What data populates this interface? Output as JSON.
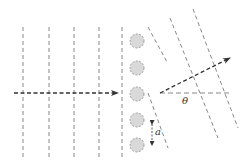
{
  "diagram": {
    "labels": {
      "angle": "θ",
      "spacing": "a"
    },
    "colors": {
      "line": "#555555",
      "arrow": "#333333",
      "scatterer_fill": "#d9d9d9",
      "scatterer_stroke": "#888888",
      "background": "#ffffff"
    },
    "incident_wavefronts_x": [
      23,
      49,
      74,
      99,
      122
    ],
    "scatterers": [
      {
        "cx": 137,
        "cy": 41
      },
      {
        "cx": 137,
        "cy": 68
      },
      {
        "cx": 137,
        "cy": 94
      },
      {
        "cx": 137,
        "cy": 120
      },
      {
        "cx": 137,
        "cy": 145
      }
    ],
    "incident_arrow": {
      "x1": 14,
      "y1": 93,
      "x2": 118,
      "y2": 93
    },
    "diffracted_arrow": {
      "x1": 160,
      "y1": 93,
      "x2": 230,
      "y2": 58
    },
    "reference_line": {
      "x1": 160,
      "y1": 93,
      "x2": 232,
      "y2": 93
    }
  }
}
